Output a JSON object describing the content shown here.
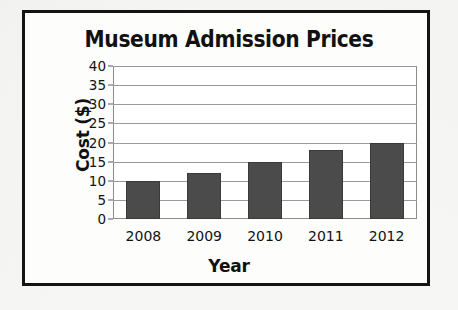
{
  "chart_data": {
    "type": "bar",
    "title": "Museum Admission Prices",
    "xlabel": "Year",
    "ylabel": "Cost ($)",
    "categories": [
      "2008",
      "2009",
      "2010",
      "2011",
      "2012"
    ],
    "values": [
      10,
      12,
      15,
      18,
      20
    ],
    "ylim": [
      0,
      40
    ],
    "ytick_step": 5,
    "yticks": [
      "0",
      "5",
      "10",
      "15",
      "20",
      "25",
      "30",
      "35",
      "40"
    ],
    "grid": true,
    "legend": false,
    "legend_position": "none",
    "bar_color": "#4b4b4b",
    "plot_background": "#ffffff",
    "gridline_color": "#9a9a9a",
    "frame_color": "#141414",
    "text_color": "#111111"
  }
}
